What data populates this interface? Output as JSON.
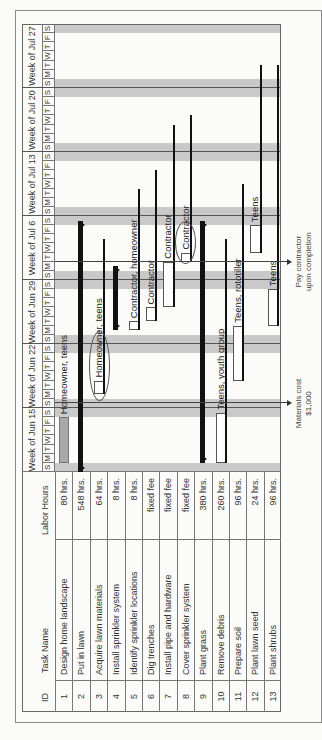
{
  "chart_data": {
    "type": "gantt",
    "orientation": "rotated 90 degrees counter-clockwise",
    "columns": [
      "ID",
      "Task Name",
      "Labor Hours"
    ],
    "weeks": [
      "Week of Jun 15",
      "Week of Jun 22",
      "Week of Jun 29",
      "Week of Jul 6",
      "Week of Jul 13",
      "Week of Jul 20",
      "Week of Jul 27"
    ],
    "day_letters": [
      "S",
      "M",
      "T",
      "W",
      "T",
      "F",
      "S"
    ],
    "tasks": [
      {
        "id": "1",
        "name": "Design home landscape",
        "labor": "80 hrs.",
        "start_day": 1,
        "end_day": 6,
        "type": "task",
        "resource": "Homeowner, teens"
      },
      {
        "id": "2",
        "name": "Put in lawn",
        "labor": "548 hrs.",
        "start_day": 0,
        "end_day": 27.5,
        "type": "summary"
      },
      {
        "id": "3",
        "name": "Acquire lawn materials",
        "labor": "64 hrs.",
        "start_day": 8.5,
        "end_day": 10,
        "type": "task",
        "resource": "Homeowner, teens",
        "slack_to_day": 25.5
      },
      {
        "id": "4",
        "name": "Install sprinkler system",
        "labor": "8 hrs.",
        "start_day": 15.5,
        "end_day": 22.5,
        "type": "summary"
      },
      {
        "id": "5",
        "name": "Identify sprinkler locations",
        "labor": "8 hrs.",
        "start_day": 15.5,
        "end_day": 16.5,
        "type": "task",
        "resource": "Contractor, homeowner",
        "slack_to_day": 31
      },
      {
        "id": "6",
        "name": "Dig trenches",
        "labor": "fixed fee",
        "start_day": 16.5,
        "end_day": 18,
        "type": "task",
        "resource": "Contractor",
        "slack_to_day": 33
      },
      {
        "id": "7",
        "name": "Install pipe and hardware",
        "labor": "fixed fee",
        "start_day": 18,
        "end_day": 23,
        "type": "task",
        "resource": "Contractor",
        "slack_to_day": 38
      },
      {
        "id": "8",
        "name": "Cover sprinkler system",
        "labor": "fixed fee",
        "start_day": 23,
        "end_day": 24,
        "type": "task",
        "resource": "Contractor",
        "slack_to_day": 39
      },
      {
        "id": "9",
        "name": "Plant grass",
        "labor": "380 hrs.",
        "start_day": 1,
        "end_day": 27.5,
        "type": "summary"
      },
      {
        "id": "10",
        "name": "Remove debris",
        "labor": "260 hrs.",
        "start_day": 1,
        "end_day": 6.5,
        "type": "task",
        "resource": "Teens, youth group",
        "slack_to_day": 25.5
      },
      {
        "id": "11",
        "name": "Prepare soil",
        "labor": "96 hrs.",
        "start_day": 10,
        "end_day": 16,
        "type": "task",
        "resource": "Teens, rototiller",
        "slack_to_day": 31.5
      },
      {
        "id": "12",
        "name": "Plant lawn seed",
        "labor": "24 hrs.",
        "start_day": 24,
        "end_day": 27,
        "type": "task",
        "resource": "Teens",
        "slack_to_day": 44.5
      },
      {
        "id": "13",
        "name": "Plant shrubs",
        "labor": "96 hrs.",
        "start_day": 16,
        "end_day": 20,
        "type": "task",
        "resource": "Teens",
        "slack_to_day": 44.5
      }
    ],
    "annotations": [
      {
        "text": "Materials cost $1,000",
        "day": 7.5
      },
      {
        "text": "Pay contractor upon completion",
        "day": 23
      }
    ]
  },
  "table": {
    "headers": {
      "id": "ID",
      "name": "Task Name",
      "labor": "Labor Hours"
    }
  },
  "annotations": {
    "materials_line1": "Materials cost",
    "materials_line2": "$1,000",
    "pay_line1": "Pay contractor",
    "pay_line2": "upon completion"
  }
}
